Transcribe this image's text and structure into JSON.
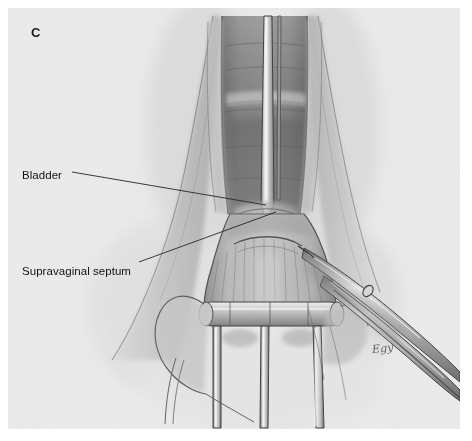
{
  "figure": {
    "panel_letter": "C",
    "background_color": "#ececec",
    "page_color": "#ffffff",
    "ink_color": "#1c1c1c",
    "signature": "Egy"
  },
  "labels": [
    {
      "id": "bladder",
      "text": "Bladder",
      "name": "bladder",
      "leader_from": [
        72,
        172
      ],
      "leader_to": [
        266,
        205
      ]
    },
    {
      "id": "supravaginal-septum",
      "text": "Supravaginal septum",
      "name": "supravaginal-septum",
      "leader_from": [
        139,
        262
      ],
      "leader_to": [
        276,
        212
      ]
    }
  ],
  "illustration": {
    "title": "Vaginal hysterectomy — supravaginal septum division",
    "subject": "surgical anatomy drawing",
    "medium": "graphite pencil rendering",
    "elements": [
      {
        "name": "vaginal-canal",
        "note": "central darker shaded tube"
      },
      {
        "name": "cervix",
        "note": "banded structure at center"
      },
      {
        "name": "bladder",
        "note": "pale dome above supravaginal septum"
      },
      {
        "name": "supravaginal-septum",
        "note": "tissue plane at cervicovesical junction"
      },
      {
        "name": "central-retractor-blade",
        "note": "narrow vertical blade in midline"
      },
      {
        "name": "vaginal-wall-left",
        "note": "left lateral fold"
      },
      {
        "name": "vaginal-wall-right",
        "note": "right lateral fold"
      },
      {
        "name": "tenaculum-prongs",
        "note": "three downward prongs on speculum rim"
      },
      {
        "name": "speculum-rim",
        "note": "horizontal bar with rounded ends"
      },
      {
        "name": "dissecting-scissors",
        "note": "long instrument entering from lower right"
      },
      {
        "name": "scissors-ring-handle",
        "note": "small oval ring on shaft"
      }
    ]
  }
}
